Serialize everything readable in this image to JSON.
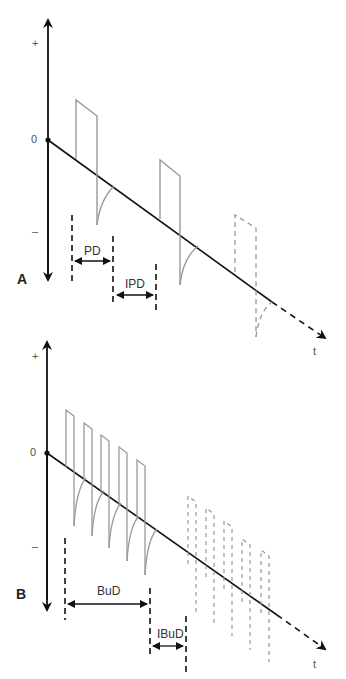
{
  "figure": {
    "panels": [
      {
        "id": "A",
        "label": "A",
        "y_axis": {
          "plus": "+",
          "zero": "0",
          "minus": "–"
        },
        "x_axis_label": "t",
        "waveform": "biphasic pulse train (single pulses)",
        "pulses_solid": 2,
        "pulses_dashed": 1,
        "dimensions": [
          {
            "name": "pulse duration",
            "label": "PD"
          },
          {
            "name": "inter-pulse duration",
            "label": "IPD"
          }
        ]
      },
      {
        "id": "B",
        "label": "B",
        "y_axis": {
          "plus": "+",
          "zero": "0",
          "minus": "–"
        },
        "x_axis_label": "t",
        "waveform": "burst pulse train",
        "pulses_solid": 5,
        "pulses_dashed": 5,
        "dimensions": [
          {
            "name": "burst duration",
            "label": "BuD"
          },
          {
            "name": "inter-burst duration",
            "label": "IBuD"
          }
        ]
      }
    ],
    "colors": {
      "axis": "#111111",
      "pulse": "#999999",
      "dashed_pulse": "#999999",
      "marker": "#111111"
    }
  }
}
